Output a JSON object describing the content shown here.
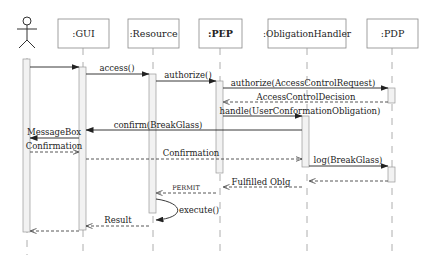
{
  "diagram": {
    "type": "sequence",
    "actor": {
      "name": "User",
      "icon": "stick-figure-icon"
    },
    "participants": [
      {
        "id": "gui",
        "label": ":GUI",
        "bold": false
      },
      {
        "id": "resource",
        "label": ":Resource",
        "bold": false
      },
      {
        "id": "pep",
        "label": ":PEP",
        "bold": true
      },
      {
        "id": "obligation",
        "label": ":ObligationHandler",
        "bold": false
      },
      {
        "id": "pdp",
        "label": ":PDP",
        "bold": false
      }
    ],
    "messages": [
      {
        "from": "actor",
        "to": "gui",
        "label": "",
        "style": "solid"
      },
      {
        "from": "gui",
        "to": "resource",
        "label": "access()",
        "style": "solid"
      },
      {
        "from": "resource",
        "to": "pep",
        "label": "authorize()",
        "style": "solid"
      },
      {
        "from": "pep",
        "to": "pdp",
        "label": "authorize(AccessControlRequest)",
        "style": "solid"
      },
      {
        "from": "pdp",
        "to": "pep",
        "label": "AccessControlDecision",
        "style": "dashed"
      },
      {
        "from": "pep",
        "to": "obligation",
        "label": "handle(UserConformationObligation)",
        "style": "solid"
      },
      {
        "from": "obligation",
        "to": "gui",
        "label": "confirm(BreakGlass)",
        "style": "solid"
      },
      {
        "from": "gui",
        "to": "actor",
        "label": "MessageBox",
        "style": "solid"
      },
      {
        "from": "actor",
        "to": "gui",
        "label": "Confirmation",
        "style": "dashed"
      },
      {
        "from": "gui",
        "to": "obligation",
        "label": "Confirmation",
        "style": "dashed"
      },
      {
        "from": "obligation",
        "to": "pdp",
        "label": "log(BreakGlass)",
        "style": "solid"
      },
      {
        "from": "pdp",
        "to": "obligation",
        "label": "",
        "style": "dashed"
      },
      {
        "from": "obligation",
        "to": "pep",
        "label": "Fulfilled Oblg",
        "style": "dashed"
      },
      {
        "from": "pep",
        "to": "resource",
        "label": "PERMIT",
        "style": "dashed"
      },
      {
        "from": "resource",
        "to": "resource",
        "label": "execute()",
        "style": "self"
      },
      {
        "from": "resource",
        "to": "gui",
        "label": "Result",
        "style": "dashed"
      },
      {
        "from": "gui",
        "to": "actor",
        "label": "",
        "style": "dashed"
      }
    ]
  }
}
